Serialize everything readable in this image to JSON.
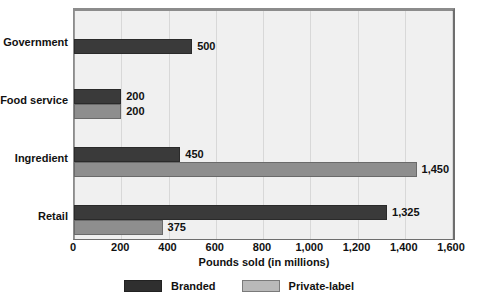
{
  "chart_data": {
    "type": "bar",
    "orientation": "horizontal",
    "title": "",
    "xlabel": "Pounds sold (in millions)",
    "ylabel": "",
    "xlim": [
      0,
      1600
    ],
    "xticks": [
      "0",
      "200",
      "400",
      "600",
      "800",
      "1,000",
      "1,200",
      "1,400",
      "1,600"
    ],
    "xtick_values": [
      0,
      200,
      400,
      600,
      800,
      1000,
      1200,
      1400,
      1600
    ],
    "grid": true,
    "legend_position": "bottom",
    "categories": [
      "Government",
      "Food service",
      "Ingredient",
      "Retail"
    ],
    "series": [
      {
        "name": "Branded",
        "color": "#3a3a3a",
        "values": [
          500,
          200,
          450,
          1325
        ],
        "labels": [
          "500",
          "200",
          "450",
          "1,325"
        ]
      },
      {
        "name": "Private-label",
        "color": "#8e8e8e",
        "values": [
          null,
          200,
          1450,
          375
        ],
        "labels": [
          "",
          "200",
          "1,450",
          "375"
        ]
      }
    ]
  },
  "axis": {
    "x_title": "Pounds sold (in millions)"
  },
  "legend": {
    "items": [
      {
        "label": "Branded",
        "color": "#2f2f2f"
      },
      {
        "label": "Private-label",
        "color": "#b9b9b9"
      }
    ]
  },
  "colors": {
    "branded": "#3a3a3a",
    "private_label": "#8e8e8e",
    "plot_background": "#f0f0f0",
    "gridline": "#d8d8d8",
    "frame": "#6e6e6e"
  }
}
